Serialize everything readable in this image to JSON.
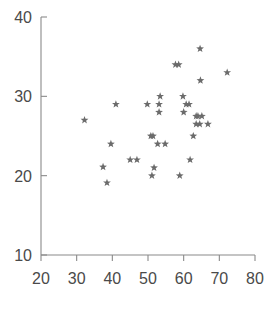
{
  "chart_data": {
    "type": "scatter",
    "title": "",
    "subtitle": "",
    "xlabel": "",
    "ylabel": "",
    "xlim": [
      20,
      80
    ],
    "ylim": [
      10,
      40
    ],
    "xticks": [
      20,
      30,
      40,
      50,
      60,
      70,
      80
    ],
    "yticks": [
      10,
      20,
      30,
      40
    ],
    "xticklabels": [
      "20",
      "30",
      "40",
      "50",
      "60",
      "70",
      "80"
    ],
    "yticklabels": [
      "10",
      "20",
      "30",
      "40"
    ],
    "grid": false,
    "legend": null,
    "marker": "star",
    "marker_color": "#6b6b6b",
    "axis_color": "#8a8a8a",
    "annotations": [],
    "series": [
      {
        "name": "data",
        "points": [
          [
            32.2,
            27.0
          ],
          [
            37.4,
            21.1
          ],
          [
            38.5,
            19.1
          ],
          [
            39.6,
            24.0
          ],
          [
            41.0,
            29.0
          ],
          [
            45.0,
            22.0
          ],
          [
            46.9,
            22.0
          ],
          [
            49.8,
            29.0
          ],
          [
            50.8,
            25.0
          ],
          [
            51.4,
            25.0
          ],
          [
            51.1,
            20.0
          ],
          [
            51.7,
            21.0
          ],
          [
            53.4,
            30.0
          ],
          [
            53.1,
            29.0
          ],
          [
            53.1,
            28.0
          ],
          [
            52.7,
            24.0
          ],
          [
            54.8,
            24.0
          ],
          [
            57.7,
            34.0
          ],
          [
            58.6,
            34.0
          ],
          [
            58.9,
            20.0
          ],
          [
            59.8,
            30.0
          ],
          [
            60.7,
            29.0
          ],
          [
            61.5,
            29.0
          ],
          [
            60.0,
            28.0
          ],
          [
            61.8,
            22.0
          ],
          [
            63.5,
            27.5
          ],
          [
            64.0,
            27.5
          ],
          [
            65.1,
            27.5
          ],
          [
            63.5,
            26.5
          ],
          [
            64.5,
            26.5
          ],
          [
            66.8,
            26.5
          ],
          [
            62.7,
            25.0
          ],
          [
            64.6,
            36.0
          ],
          [
            64.7,
            32.0
          ],
          [
            72.2,
            33.0
          ]
        ]
      }
    ]
  },
  "figure": {
    "background_color": "#ffffff",
    "width": 266,
    "height": 314
  }
}
